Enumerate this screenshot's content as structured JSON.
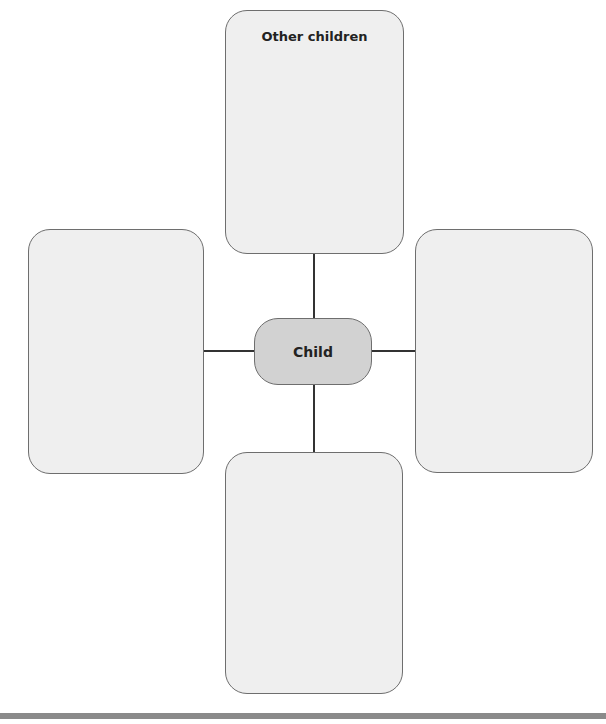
{
  "diagram": {
    "center": {
      "label": "Child"
    },
    "top_box": {
      "label": "Other children"
    },
    "left_box": {
      "label": ""
    },
    "right_box": {
      "label": ""
    },
    "bottom_box": {
      "label": ""
    }
  },
  "colors": {
    "box_fill": "#efefef",
    "center_fill": "#d2d2d2",
    "border": "#6e6e6e",
    "footer_bar": "#8a8a8a"
  }
}
